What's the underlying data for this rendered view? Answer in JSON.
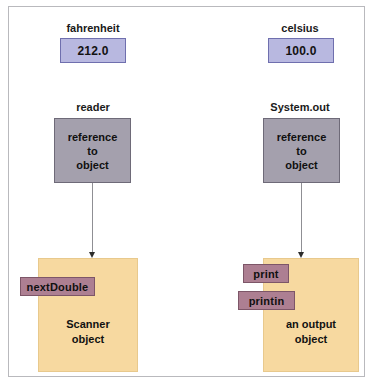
{
  "diagram": {
    "top_cut_text": "",
    "columns": [
      {
        "id": "left",
        "variable_label": "fahrenheit",
        "value": "212.0",
        "reference_label": "reader",
        "reference_text_line1": "reference",
        "reference_text_line2": "to",
        "reference_text_line3": "object",
        "object_caption_line1": "Scanner",
        "object_caption_line2": "object",
        "methods": [
          "nextDouble"
        ]
      },
      {
        "id": "right",
        "variable_label": "celsius",
        "value": "100.0",
        "reference_label": "System.out",
        "reference_text_line1": "reference",
        "reference_text_line2": "to",
        "reference_text_line3": "object",
        "object_caption_line1": "an output",
        "object_caption_line2": "object",
        "methods": [
          "print",
          "printin"
        ]
      }
    ],
    "colors": {
      "value_box_fill": "#b8b8e0",
      "value_box_border": "#6f6fae",
      "reference_box_fill": "#a4a0ad",
      "reference_box_border": "#6e6a78",
      "object_box_fill": "#f7d9a0",
      "object_box_border": "#e8c98d",
      "method_tab_fill": "#ad7f92",
      "method_tab_border": "#7d5668",
      "arrow": "#8f8f94",
      "frame_border": "#b9b9bd"
    }
  }
}
